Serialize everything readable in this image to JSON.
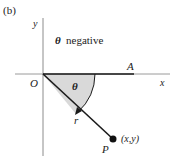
{
  "figure": {
    "panel_label": "(b)",
    "caption_text": "θ negative",
    "caption_theta": "θ",
    "caption_word": "negative"
  },
  "axes": {
    "x_label": "x",
    "y_label": "y",
    "origin_label": "O"
  },
  "points": {
    "A_label": "A",
    "P_label": "P",
    "P_coords": "(x,y)"
  },
  "annotations": {
    "angle_label": "θ",
    "radius_label": "r"
  },
  "colors": {
    "line_dark": "#1a1a1a",
    "axis_gray": "#9a9a9a",
    "sector_fill": "#d9d9d9"
  }
}
